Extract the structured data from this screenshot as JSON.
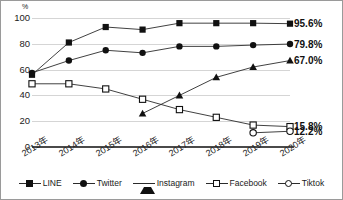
{
  "chart_data": {
    "type": "line",
    "title": "",
    "xlabel": "",
    "ylabel": "%",
    "y_unit": "%",
    "ylim": [
      0,
      100
    ],
    "yticks": [
      0,
      20,
      40,
      60,
      80,
      100
    ],
    "ytick_labels": [
      "0",
      "20",
      "40",
      "60",
      "80",
      "100"
    ],
    "grid": true,
    "legend_position": "bottom",
    "categories": [
      "2013年",
      "2014年",
      "2015年",
      "2016年",
      "2017年",
      "2018年",
      "2019年",
      "2020年"
    ],
    "series": [
      {
        "name": "LINE",
        "marker": "filled-square",
        "values": [
          56.0,
          81.0,
          93.0,
          91.0,
          96.0,
          96.0,
          96.0,
          95.6
        ],
        "end_label": "95.6%"
      },
      {
        "name": "Twitter",
        "marker": "filled-circle",
        "values": [
          57.5,
          67.0,
          75.0,
          73.0,
          78.0,
          78.0,
          79.0,
          79.8
        ],
        "end_label": "79.8%"
      },
      {
        "name": "Instagram",
        "marker": "filled-triangle",
        "values": [
          null,
          null,
          null,
          26.0,
          40.0,
          54.0,
          62.0,
          67.0
        ],
        "end_label": "67.0%"
      },
      {
        "name": "Facebook",
        "marker": "open-square",
        "values": [
          49.0,
          49.0,
          45.0,
          37.0,
          29.0,
          23.0,
          17.0,
          15.8
        ],
        "end_label": "15.8%"
      },
      {
        "name": "Tiktok",
        "marker": "open-circle",
        "values": [
          null,
          null,
          null,
          null,
          null,
          null,
          11.0,
          12.2
        ],
        "end_label": "12.2%"
      }
    ],
    "end_labels": [
      "95.6%",
      "79.8%",
      "67.0%",
      "15.8%",
      "12.2%"
    ],
    "colors": {
      "line": "#2b2b2b",
      "marker_fill": "#111111",
      "marker_open": "#ffffff",
      "grid": "#d5d5d5",
      "axis": "#4a4a4a",
      "text": "#1a1a1a",
      "background": "#ffffff",
      "border": "#9a9a9a"
    }
  },
  "legend": {
    "items": [
      {
        "label": "LINE"
      },
      {
        "label": "Twitter"
      },
      {
        "label": "Instagram"
      },
      {
        "label": "Facebook"
      },
      {
        "label": "Tiktok"
      }
    ]
  }
}
